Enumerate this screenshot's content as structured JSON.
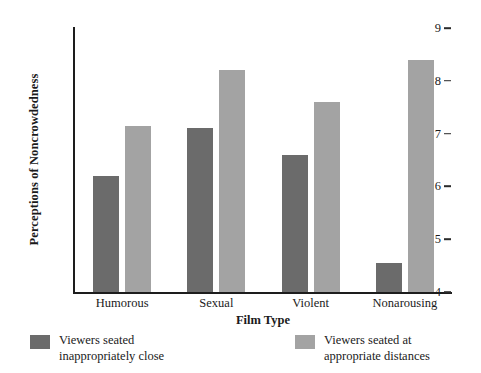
{
  "chart_data": {
    "type": "bar",
    "title": "",
    "subtitle": "",
    "xlabel": "Film Type",
    "ylabel": "Perceptions of Noncrowdedness",
    "categories": [
      "Humorous",
      "Sexual",
      "Violent",
      "Nonarousing"
    ],
    "series": [
      {
        "name": "Viewers seated inappropriately close",
        "color": "#6b6b6b",
        "values": [
          6.2,
          7.1,
          6.6,
          4.55
        ]
      },
      {
        "name": "Viewers seated at appropriate distances",
        "color": "#a3a3a3",
        "values": [
          7.15,
          8.2,
          7.6,
          8.4
        ]
      }
    ],
    "ylim": [
      4,
      9
    ],
    "yticks": [
      4,
      5,
      6,
      7,
      8,
      9
    ],
    "ytick_labels": [
      "4",
      "5",
      "6",
      "7",
      "8",
      "9"
    ],
    "grid": false,
    "legend_position": "bottom",
    "axis_style": "left-and-bottom-spines-only"
  },
  "legend": {
    "items": [
      {
        "label": "Viewers seated\ninappropriately close",
        "color": "#6b6b6b"
      },
      {
        "label": "Viewers seated at\nappropriate distances",
        "color": "#a3a3a3"
      }
    ]
  },
  "colors": {
    "dark_bar": "#6b6b6b",
    "light_bar": "#a3a3a3",
    "axis": "#1d1d1d",
    "background": "#ffffff",
    "text": "#1a1a1a"
  }
}
